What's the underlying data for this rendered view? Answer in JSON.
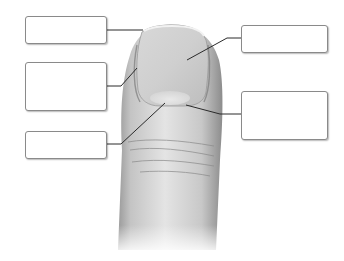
{
  "diagram": {
    "colors": {
      "background": "#ffffff",
      "skin_light": "#e6e6e6",
      "skin_mid": "#c2c2c2",
      "skin_dark": "#8e8e8e",
      "nail": "#d4d4d4",
      "leader_line": "#2a2a2a",
      "box_border": "#8a8a8a"
    },
    "labels": [
      {
        "id": "label-1",
        "text": "",
        "target": "free edge of nail"
      },
      {
        "id": "label-2",
        "text": "",
        "target": "nail fold / lateral edge"
      },
      {
        "id": "label-3",
        "text": "",
        "target": "lunula"
      },
      {
        "id": "label-4",
        "text": "",
        "target": "nail body"
      },
      {
        "id": "label-5",
        "text": "",
        "target": "cuticle / eponychium"
      }
    ]
  }
}
